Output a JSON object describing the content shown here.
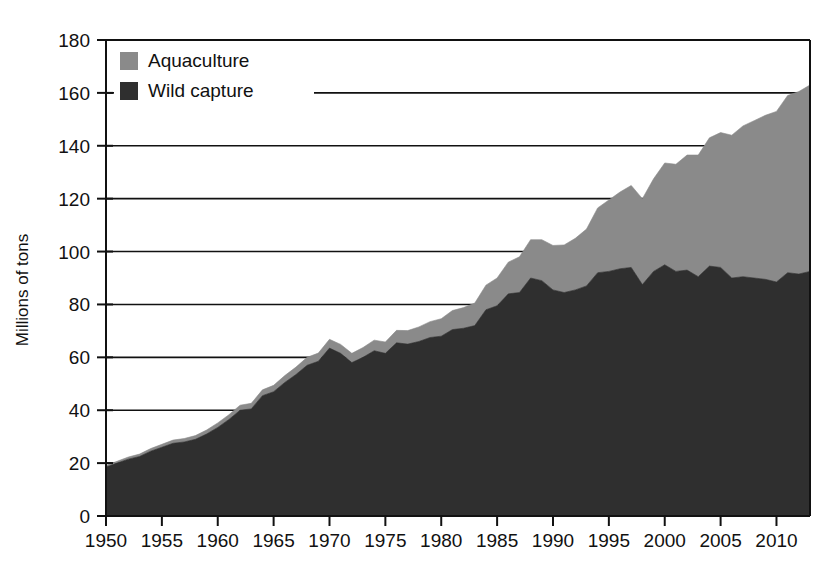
{
  "chart_data": {
    "type": "area",
    "title": "",
    "subtitle": "",
    "xlabel": "",
    "ylabel": "Millions of tons",
    "xlim": [
      1950,
      2013
    ],
    "ylim": [
      0,
      180
    ],
    "ytick_step": 20,
    "xtick_step": 5,
    "grid": true,
    "stacked": true,
    "legend_position": "top-left-inside",
    "yticks": [
      "0",
      "20",
      "40",
      "60",
      "80",
      "100",
      "120",
      "140",
      "160",
      "180"
    ],
    "xticks": [
      "1950",
      "1955",
      "1960",
      "1965",
      "1970",
      "1975",
      "1980",
      "1985",
      "1990",
      "1995",
      "2000",
      "2005",
      "2010"
    ],
    "colors": {
      "aquaculture": "#8a8a8a",
      "wild_capture": "#2f2f2f",
      "axis": "#111111",
      "grid": "#111111",
      "background": "#ffffff"
    },
    "legend": [
      {
        "name": "Aquaculture",
        "color": "#8a8a8a"
      },
      {
        "name": "Wild capture",
        "color": "#2f2f2f"
      }
    ],
    "x": [
      1950,
      1951,
      1952,
      1953,
      1954,
      1955,
      1956,
      1957,
      1958,
      1959,
      1960,
      1961,
      1962,
      1963,
      1964,
      1965,
      1966,
      1967,
      1968,
      1969,
      1970,
      1971,
      1972,
      1973,
      1974,
      1975,
      1976,
      1977,
      1978,
      1979,
      1980,
      1981,
      1982,
      1983,
      1984,
      1985,
      1986,
      1987,
      1988,
      1989,
      1990,
      1991,
      1992,
      1993,
      1994,
      1995,
      1996,
      1997,
      1998,
      1999,
      2000,
      2001,
      2002,
      2003,
      2004,
      2005,
      2006,
      2007,
      2008,
      2009,
      2010,
      2011,
      2012,
      2013
    ],
    "series": [
      {
        "name": "Wild capture",
        "color": "#2f2f2f",
        "values": [
          18.5,
          20.0,
          21.5,
          22.5,
          24.5,
          26.0,
          27.5,
          28.0,
          29.0,
          31.0,
          33.5,
          36.5,
          40.0,
          40.5,
          45.5,
          47.0,
          50.5,
          53.5,
          57.0,
          58.5,
          63.5,
          61.5,
          58.0,
          60.0,
          62.5,
          61.5,
          65.5,
          65.0,
          66.0,
          67.5,
          68.0,
          70.5,
          71.0,
          72.0,
          78.0,
          79.5,
          84.0,
          84.5,
          90.0,
          89.0,
          85.5,
          84.5,
          85.5,
          87.0,
          92.0,
          92.5,
          93.5,
          94.0,
          87.5,
          92.5,
          95.0,
          92.5,
          93.0,
          90.5,
          94.5,
          94.0,
          90.0,
          90.5,
          90.0,
          89.5,
          88.5,
          92.0,
          91.5,
          92.5
        ]
      },
      {
        "name": "Aquaculture",
        "color": "#8a8a8a",
        "values": [
          0.6,
          0.7,
          0.8,
          0.9,
          1.0,
          1.1,
          1.2,
          1.3,
          1.4,
          1.5,
          1.7,
          1.8,
          1.9,
          2.1,
          2.2,
          2.4,
          2.6,
          2.8,
          3.0,
          3.1,
          3.3,
          3.4,
          3.5,
          3.7,
          4.0,
          4.3,
          4.7,
          5.1,
          5.5,
          6.0,
          6.6,
          7.2,
          7.8,
          8.5,
          9.3,
          10.5,
          12.0,
          13.5,
          14.5,
          15.5,
          16.8,
          18.0,
          19.5,
          21.5,
          24.5,
          27.0,
          29.0,
          31.0,
          32.5,
          35.0,
          38.5,
          40.5,
          43.5,
          46.0,
          48.5,
          51.0,
          54.0,
          57.0,
          59.5,
          62.0,
          64.5,
          67.0,
          69.0,
          70.5
        ]
      }
    ],
    "annotations": [
      {
        "label": "1970 peak in wild capture",
        "x": 1970,
        "y": 67
      },
      {
        "label": "1997-98 El Nino dip",
        "x": 1998,
        "y": 120
      }
    ]
  }
}
